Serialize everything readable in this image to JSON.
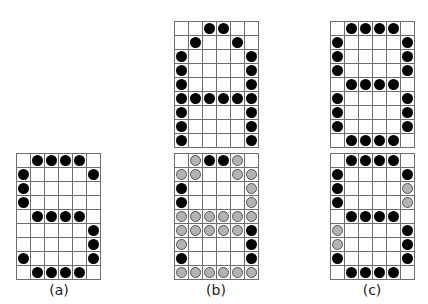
{
  "legend": {
    "B": "filled black dot",
    "G": "filled gray dot",
    ".": "empty cell"
  },
  "colors": {
    "black_dot": "#000000",
    "gray_dot": "#b3b3b3",
    "grid_line": "#6e6e6e"
  },
  "panels": [
    {
      "label": "(a)",
      "grids": [
        {
          "rows": [
            ".BBBB.",
            "B....B",
            "B.....",
            "B.....",
            ".BBBB.",
            ".....B",
            ".....B",
            "B....B",
            ".BBBB."
          ]
        }
      ]
    },
    {
      "label": "(b)",
      "grids": [
        {
          "rows": [
            "..BB..",
            ".B..B.",
            "B....B",
            "B....B",
            "B....B",
            "BBBBBB",
            "B....B",
            "B....B",
            "B....B"
          ]
        },
        {
          "rows": [
            ".GBBG.",
            "GG..GG",
            "B....G",
            "B....G",
            "GGGGGG",
            "GGGGGB",
            "G....B",
            "B....B",
            "GGGGGG"
          ]
        }
      ]
    },
    {
      "label": "(c)",
      "grids": [
        {
          "rows": [
            ".BBBB.",
            "B....B",
            "B....B",
            "B....B",
            ".BBBB.",
            "B....B",
            "B....B",
            "B....B",
            ".BBBB."
          ]
        },
        {
          "rows": [
            ".BBBB.",
            "B....B",
            "B....G",
            "B....G",
            ".BBBB.",
            "G....B",
            "G....B",
            "B....B",
            ".BBBB."
          ]
        }
      ]
    }
  ]
}
